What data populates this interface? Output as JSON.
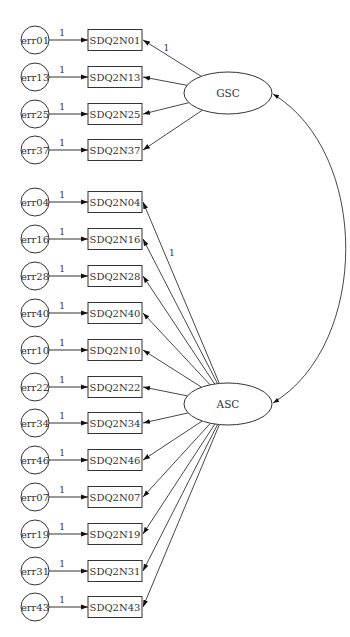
{
  "diagram": {
    "type": "sem-path-diagram",
    "colors": {
      "stroke": "#333333",
      "fill": "#ffffff",
      "text": "#333333"
    },
    "latent_factors": [
      {
        "id": "GSC",
        "label": "GSC",
        "cx": 228,
        "cy": 93
      },
      {
        "id": "ASC",
        "label": "ASC",
        "cx": 228,
        "cy": 404
      }
    ],
    "indicators": [
      {
        "label": "SDQ2N01",
        "error": "err01",
        "factor": "GSC",
        "y": 40,
        "loading_label": "1",
        "error_label": "1"
      },
      {
        "label": "SDQ2N13",
        "error": "err13",
        "factor": "GSC",
        "y": 77,
        "loading_label": "",
        "error_label": "1"
      },
      {
        "label": "SDQ2N25",
        "error": "err25",
        "factor": "GSC",
        "y": 114,
        "loading_label": "",
        "error_label": "1"
      },
      {
        "label": "SDQ2N37",
        "error": "err37",
        "factor": "GSC",
        "y": 150,
        "loading_label": "",
        "error_label": "1"
      },
      {
        "label": "SDQ2N04",
        "error": "err04",
        "factor": "ASC",
        "y": 202,
        "loading_label": "1",
        "error_label": "1"
      },
      {
        "label": "SDQ2N16",
        "error": "err16",
        "factor": "ASC",
        "y": 239,
        "loading_label": "",
        "error_label": "1"
      },
      {
        "label": "SDQ2N28",
        "error": "err28",
        "factor": "ASC",
        "y": 276,
        "loading_label": "",
        "error_label": "1"
      },
      {
        "label": "SDQ2N40",
        "error": "err40",
        "factor": "ASC",
        "y": 313,
        "loading_label": "",
        "error_label": "1"
      },
      {
        "label": "SDQ2N10",
        "error": "err10",
        "factor": "ASC",
        "y": 350,
        "loading_label": "",
        "error_label": "1"
      },
      {
        "label": "SDQ2N22",
        "error": "err22",
        "factor": "ASC",
        "y": 387,
        "loading_label": "",
        "error_label": "1"
      },
      {
        "label": "SDQ2N34",
        "error": "err34",
        "factor": "ASC",
        "y": 423,
        "loading_label": "",
        "error_label": "1"
      },
      {
        "label": "SDQ2N46",
        "error": "err46",
        "factor": "ASC",
        "y": 460,
        "loading_label": "",
        "error_label": "1"
      },
      {
        "label": "SDQ2N07",
        "error": "err07",
        "factor": "ASC",
        "y": 497,
        "loading_label": "",
        "error_label": "1"
      },
      {
        "label": "SDQ2N19",
        "error": "err19",
        "factor": "ASC",
        "y": 534,
        "loading_label": "",
        "error_label": "1"
      },
      {
        "label": "SDQ2N31",
        "error": "err31",
        "factor": "ASC",
        "y": 571,
        "loading_label": "",
        "error_label": "1"
      },
      {
        "label": "SDQ2N43",
        "error": "err43",
        "factor": "ASC",
        "y": 607,
        "loading_label": "",
        "error_label": "1"
      }
    ],
    "covariances": [
      {
        "from": "GSC",
        "to": "ASC",
        "label": ""
      }
    ]
  }
}
